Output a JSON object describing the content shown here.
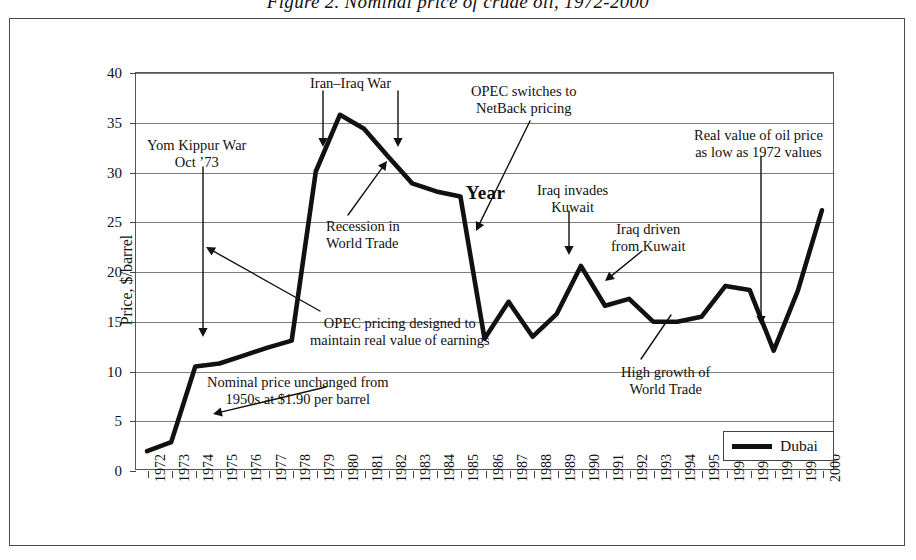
{
  "figure": {
    "title": "Figure 2.  Nominal price of crude oil, 1972-2000"
  },
  "chart_data": {
    "type": "line",
    "title": "Figure 2.  Nominal price of crude oil, 1972-2000",
    "xlabel": "Year",
    "ylabel": "Price, $/barrel",
    "ylim": [
      0,
      40
    ],
    "ytick_step": 5,
    "yticks": [
      "0",
      "5",
      "10",
      "15",
      "20",
      "25",
      "30",
      "35",
      "40"
    ],
    "grid": "horizontal",
    "legend_position": "bottom-right",
    "categories": [
      "1972",
      "1973",
      "1974",
      "1975",
      "1976",
      "1977",
      "1978",
      "1979",
      "1980",
      "1981",
      "1982",
      "1983",
      "1984",
      "1985",
      "1986",
      "1987",
      "1988",
      "1989",
      "1990",
      "1991",
      "1992",
      "1993",
      "1994",
      "1995",
      "1996",
      "1997",
      "1998",
      "1999",
      "2000"
    ],
    "series": [
      {
        "name": "Dubai",
        "color": "#111111",
        "values": [
          1.9,
          2.8,
          10.4,
          10.7,
          11.5,
          12.3,
          13.0,
          30.0,
          35.7,
          34.3,
          31.5,
          28.8,
          28.0,
          27.5,
          13.2,
          16.9,
          13.4,
          15.7,
          20.5,
          16.5,
          17.2,
          14.9,
          14.9,
          15.4,
          18.5,
          18.1,
          12.0,
          18.0,
          26.1
        ]
      }
    ],
    "annotations": [
      {
        "id": "yom-kippur",
        "lines": [
          "Yom Kippur War",
          "Oct ’73"
        ],
        "pointer": "vertical-arrow-down",
        "target_year": "1974"
      },
      {
        "id": "iran-iraq-war",
        "lines": [
          "Iran–Iraq War"
        ],
        "pointer": "two-vertical-arrows-down",
        "target_year": "1979 / 1982"
      },
      {
        "id": "opec-netback",
        "lines": [
          "OPEC switches to",
          "NetBack pricing"
        ],
        "pointer": "diagonal-arrow",
        "target_year": "1986"
      },
      {
        "id": "iraq-invades-kuwait",
        "lines": [
          "Iraq invades",
          "Kuwait"
        ],
        "pointer": "vertical-arrow-down",
        "target_year": "1990"
      },
      {
        "id": "iraq-driven-from-kuwait",
        "lines": [
          "Iraq driven",
          "from Kuwait"
        ],
        "pointer": "diagonal-arrow",
        "target_year": "1991"
      },
      {
        "id": "real-value-1972",
        "lines": [
          "Real value of oil price",
          "as low as 1972 values"
        ],
        "pointer": "vertical-arrow-down",
        "target_year": "1998"
      },
      {
        "id": "recession-world-trade",
        "lines": [
          "Recession in",
          "World Trade"
        ],
        "pointer": "diagonal-arrow",
        "target_year": "1982"
      },
      {
        "id": "opec-pricing",
        "lines": [
          "OPEC pricing designed to",
          "maintain real value of earnings"
        ],
        "pointer": "diagonal-arrow",
        "target_year": "1979"
      },
      {
        "id": "nominal-price-unchanged",
        "lines": [
          "Nominal price unchanged from",
          "1950s at $1.90 per barrel"
        ],
        "pointer": "diagonal-arrow",
        "target_year": "1973"
      },
      {
        "id": "high-growth-world-trade",
        "lines": [
          "High growth of",
          "World Trade"
        ],
        "pointer": "diagonal-arrow",
        "target_year": "1996"
      }
    ]
  },
  "legend": {
    "entries": [
      {
        "label": "Dubai",
        "color": "#111111"
      }
    ]
  }
}
